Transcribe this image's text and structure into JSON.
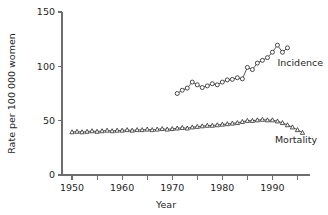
{
  "chart_data": {
    "type": "line",
    "title": "",
    "xlabel": "Year",
    "ylabel": "Rate per 100 000 women",
    "xlim": [
      1948,
      1997.5
    ],
    "ylim": [
      0,
      150
    ],
    "grid": false,
    "legend_position": "inline-right",
    "y_ticks": [
      0,
      50,
      100,
      150
    ],
    "y_tick_labels": [
      "0",
      "50",
      "100",
      "150"
    ],
    "x_ticks_major": [
      1950,
      1960,
      1970,
      1980,
      1990
    ],
    "x_tick_labels": [
      "1950",
      "1960",
      "1970",
      "1980",
      "1990"
    ],
    "x_ticks_minor": [
      1955,
      1965,
      1975,
      1985,
      1995
    ],
    "series": [
      {
        "name": "Incidence",
        "marker": "open-circle",
        "label_x": 1991.0,
        "label_y": 100.0,
        "x": [
          1971,
          1972,
          1973,
          1974,
          1975,
          1976,
          1977,
          1978,
          1979,
          1980,
          1981,
          1982,
          1983,
          1984,
          1985,
          1986,
          1987,
          1988,
          1989,
          1990,
          1991,
          1992,
          1993
        ],
        "values": [
          75.0,
          78.0,
          80.0,
          85.5,
          83.0,
          80.5,
          82.0,
          84.0,
          83.0,
          85.5,
          87.5,
          88.0,
          89.5,
          88.5,
          99.0,
          97.0,
          103.0,
          105.5,
          108.0,
          113.0,
          119.5,
          113.0,
          117.0
        ]
      },
      {
        "name": "Mortality",
        "marker": "open-triangle",
        "label_x": 1990.5,
        "label_y": 29.0,
        "x": [
          1950,
          1951,
          1952,
          1953,
          1954,
          1955,
          1956,
          1957,
          1958,
          1959,
          1960,
          1961,
          1962,
          1963,
          1964,
          1965,
          1966,
          1967,
          1968,
          1969,
          1970,
          1971,
          1972,
          1973,
          1974,
          1975,
          1976,
          1977,
          1978,
          1979,
          1980,
          1981,
          1982,
          1983,
          1984,
          1985,
          1986,
          1987,
          1988,
          1989,
          1990,
          1991,
          1992,
          1993,
          1994,
          1995,
          1996
        ],
        "values": [
          39.5,
          40.0,
          39.5,
          40.0,
          40.5,
          40.0,
          40.5,
          41.0,
          40.5,
          41.0,
          41.0,
          41.5,
          41.0,
          41.5,
          41.5,
          42.0,
          41.5,
          42.0,
          42.5,
          42.0,
          42.5,
          43.0,
          43.5,
          43.0,
          44.0,
          44.5,
          45.0,
          45.5,
          45.5,
          46.0,
          46.5,
          47.0,
          47.5,
          48.0,
          49.0,
          50.0,
          50.0,
          50.5,
          51.0,
          50.5,
          50.5,
          49.5,
          48.0,
          46.0,
          44.0,
          41.5,
          39.0
        ]
      }
    ]
  }
}
